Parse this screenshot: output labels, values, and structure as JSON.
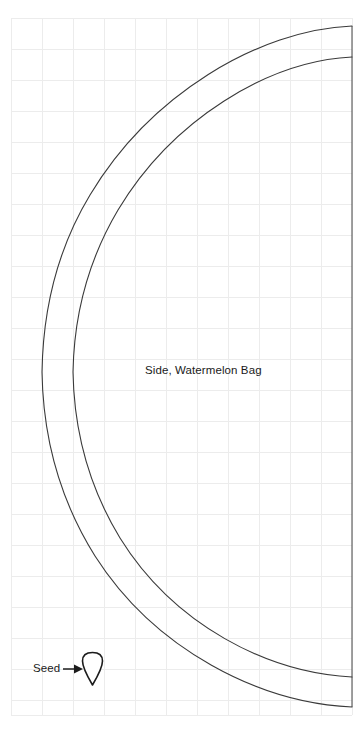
{
  "sheet": {
    "background_color": "#ffffff",
    "width": 364,
    "height": 732
  },
  "grid": {
    "line_color": "#ececec",
    "cell_size": 31,
    "origin_x": 11,
    "origin_y": 18,
    "columns": 11,
    "rows": 22,
    "right_edge_x": 352,
    "bottom_edge_y": 715
  },
  "labels": {
    "piece_name": "Side, Watermelon Bag",
    "seed_name": "Seed"
  },
  "pattern": {
    "stroke_color": "#3a3a3a",
    "seed_stroke_color": "#1c1c1c",
    "outer_curve": {
      "name": "cut-line",
      "start": [
        352,
        26
      ],
      "apex_left_x": 42,
      "apex_left_y": 372,
      "end": [
        352,
        707
      ]
    },
    "inner_curve": {
      "name": "seam-line",
      "start": [
        352,
        57
      ],
      "apex_left_x": 73,
      "apex_left_y": 372,
      "end": [
        352,
        677
      ]
    },
    "right_edge": {
      "name": "fold-edge",
      "x": 352,
      "top_y": 26,
      "bottom_y": 707
    },
    "seed": {
      "center_x": 92.5,
      "top_y": 653,
      "bottom_y": 685,
      "half_width": 10
    },
    "leader": {
      "from_x": 63,
      "to_x": 83,
      "y": 669
    }
  }
}
